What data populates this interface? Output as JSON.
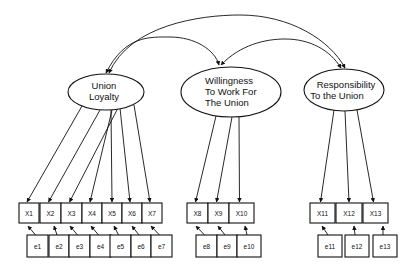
{
  "diagram": {
    "type": "structural-equation-model",
    "latent_factors": [
      {
        "id": "union_loyalty",
        "lines": [
          "Union",
          "Loyalty"
        ],
        "indicators": [
          "X1",
          "X2",
          "X3",
          "X4",
          "X5",
          "X6",
          "X7"
        ]
      },
      {
        "id": "willingness",
        "lines": [
          "Willingness",
          "To Work For",
          "The Union"
        ],
        "indicators": [
          "X8",
          "X9",
          "X10"
        ]
      },
      {
        "id": "responsibility",
        "lines": [
          "Responsibility",
          "To the Union"
        ],
        "indicators": [
          "X11",
          "X12",
          "X13"
        ]
      }
    ],
    "indicators": [
      "X1",
      "X2",
      "X3",
      "X4",
      "X5",
      "X6",
      "X7",
      "X8",
      "X9",
      "X10",
      "X11",
      "X12",
      "X13"
    ],
    "errors": [
      "e1",
      "e2",
      "e3",
      "e4",
      "e5",
      "e6",
      "e7",
      "e8",
      "e9",
      "e10",
      "e11",
      "e12",
      "e13"
    ],
    "correlations": [
      {
        "from": "union_loyalty",
        "to": "willingness"
      },
      {
        "from": "union_loyalty",
        "to": "responsibility"
      },
      {
        "from": "willingness",
        "to": "responsibility"
      }
    ]
  }
}
